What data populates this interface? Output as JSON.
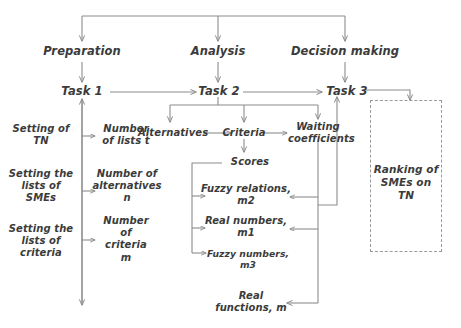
{
  "diagram": {
    "phases": [
      {
        "id": "preparation",
        "label": "Preparation"
      },
      {
        "id": "analysis",
        "label": "Analysis"
      },
      {
        "id": "decision-making",
        "label": "Decision making"
      }
    ],
    "tasks": [
      {
        "id": "task-1",
        "label": "Task 1"
      },
      {
        "id": "task-2",
        "label": "Task 2"
      },
      {
        "id": "task-3",
        "label": "Task 3"
      }
    ],
    "preparation_steps": [
      {
        "id": "setting-of-tn",
        "label": "Setting of\nTN"
      },
      {
        "id": "setting-lists-smes",
        "label": "Setting the\nlists of\nSMEs"
      },
      {
        "id": "setting-lists-criteria",
        "label": "Setting the\nlists of\ncriteria"
      }
    ],
    "preparation_outputs": [
      {
        "id": "number-of-lists",
        "label": "Number\nof lists t"
      },
      {
        "id": "number-of-alternatives",
        "label": "Number of\nalternatives\nn"
      },
      {
        "id": "number-of-criteria",
        "label": "Number\nof\ncriteria\nm"
      }
    ],
    "analysis_nodes": [
      {
        "id": "alternatives",
        "label": "Alternatives"
      },
      {
        "id": "criteria",
        "label": "Criteria"
      },
      {
        "id": "waiting-coefficients",
        "label": "Waiting\ncoefficients"
      }
    ],
    "scores": {
      "id": "scores",
      "label": "Scores"
    },
    "score_types": [
      {
        "id": "fuzzy-relations-m2",
        "label": "Fuzzy relations,\nm2"
      },
      {
        "id": "real-numbers-m1",
        "label": "Real numbers,\nm1"
      },
      {
        "id": "fuzzy-numbers-m3",
        "label": "Fuzzy numbers,\nm3"
      }
    ],
    "real_functions": {
      "id": "real-functions-m",
      "label": "Real\nfunctions, m"
    },
    "result": {
      "id": "ranking-of-smes",
      "label": "Ranking   of\nSMEs on TN"
    },
    "colors": {
      "line": "#8c8c8c",
      "text": "#3b3b3b",
      "dashed_border": "#9a9a9a",
      "background": "#ffffff"
    }
  }
}
